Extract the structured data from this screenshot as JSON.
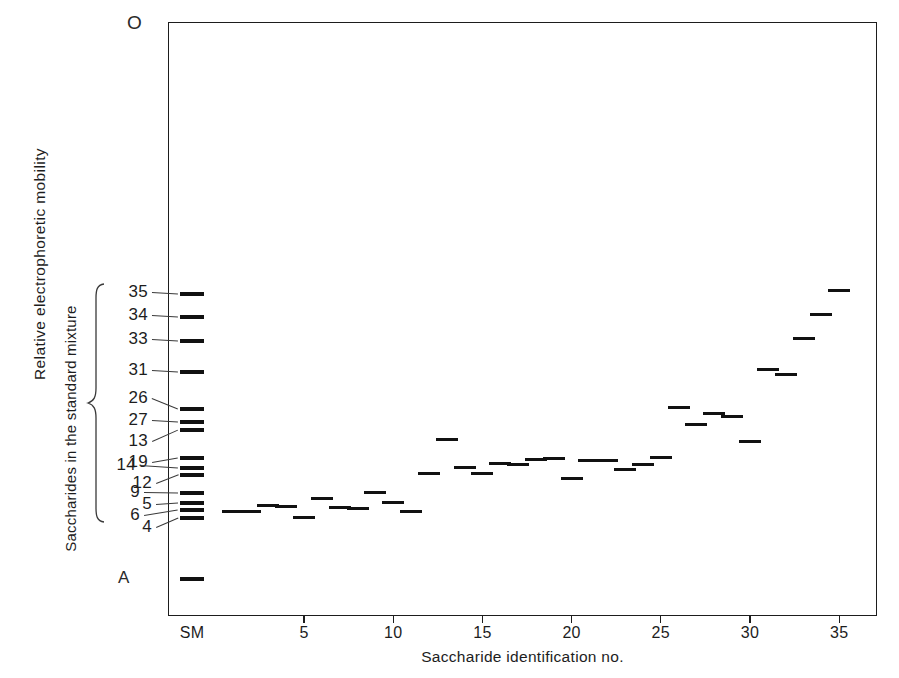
{
  "figure": {
    "origin_marker": "O",
    "ylabel_primary": "Relative  electrophoretic  mobility",
    "ylabel_secondary": "Saccharides in the standard mixture",
    "xlabel": "Saccharide identification no.",
    "anode_marker": "A"
  },
  "chart_data": {
    "type": "scatter",
    "title": "",
    "subtitle": "",
    "xlabel": "Saccharide identification no.",
    "ylabel": "Relative  electrophoretic  mobility",
    "grid": false,
    "legend": "none",
    "xlim": [
      0,
      36
    ],
    "xticks": [
      "SM",
      "5",
      "10",
      "15",
      "20",
      "25",
      "30",
      "35"
    ],
    "xtick_values": [
      0,
      5,
      10,
      15,
      20,
      25,
      30,
      35
    ],
    "ylim_px": [
      22,
      616
    ],
    "y_axis_direction": "inverted",
    "standard_mixture_lane": {
      "label": "SM",
      "x_value": 0,
      "bands": [
        {
          "id": "35",
          "mobility_px": 292
        },
        {
          "id": "34",
          "mobility_px": 315
        },
        {
          "id": "33",
          "mobility_px": 339
        },
        {
          "id": "31",
          "mobility_px": 370
        },
        {
          "id": "26",
          "mobility_px": 407
        },
        {
          "id": "27",
          "mobility_px": 420
        },
        {
          "id": "13",
          "mobility_px": 428
        },
        {
          "id": "19",
          "mobility_px": 456
        },
        {
          "id": "14",
          "mobility_px": 466
        },
        {
          "id": "12",
          "mobility_px": 473
        },
        {
          "id": "9",
          "mobility_px": 491
        },
        {
          "id": "5",
          "mobility_px": 501
        },
        {
          "id": "6",
          "mobility_px": 508
        },
        {
          "id": "4",
          "mobility_px": 516
        },
        {
          "id": "A",
          "mobility_px": 577
        }
      ],
      "label_order_top_to_bottom": [
        "35",
        "34",
        "33",
        "31",
        "26",
        "27",
        "13",
        "19",
        "14",
        "12",
        "9",
        "5",
        "6",
        "4"
      ]
    },
    "sample_lanes": [
      {
        "x": 1,
        "mobility_px": 510
      },
      {
        "x": 2,
        "mobility_px": 510
      },
      {
        "x": 3,
        "mobility_px": 504
      },
      {
        "x": 4,
        "mobility_px": 505
      },
      {
        "x": 5,
        "mobility_px": 516
      },
      {
        "x": 6,
        "mobility_px": 497
      },
      {
        "x": 7,
        "mobility_px": 506
      },
      {
        "x": 8,
        "mobility_px": 507
      },
      {
        "x": 9,
        "mobility_px": 491
      },
      {
        "x": 10,
        "mobility_px": 501
      },
      {
        "x": 11,
        "mobility_px": 510
      },
      {
        "x": 12,
        "mobility_px": 472
      },
      {
        "x": 13,
        "mobility_px": 438
      },
      {
        "x": 14,
        "mobility_px": 466
      },
      {
        "x": 15,
        "mobility_px": 472
      },
      {
        "x": 16,
        "mobility_px": 462
      },
      {
        "x": 17,
        "mobility_px": 463
      },
      {
        "x": 18,
        "mobility_px": 458
      },
      {
        "x": 19,
        "mobility_px": 457
      },
      {
        "x": 20,
        "mobility_px": 477
      },
      {
        "x": 21,
        "mobility_px": 459
      },
      {
        "x": 22,
        "mobility_px": 459
      },
      {
        "x": 23,
        "mobility_px": 468
      },
      {
        "x": 24,
        "mobility_px": 463
      },
      {
        "x": 25,
        "mobility_px": 456
      },
      {
        "x": 26,
        "mobility_px": 406
      },
      {
        "x": 27,
        "mobility_px": 423
      },
      {
        "x": 28,
        "mobility_px": 412
      },
      {
        "x": 29,
        "mobility_px": 415
      },
      {
        "x": 30,
        "mobility_px": 440
      },
      {
        "x": 31,
        "mobility_px": 368
      },
      {
        "x": 32,
        "mobility_px": 373
      },
      {
        "x": 33,
        "mobility_px": 337
      },
      {
        "x": 34,
        "mobility_px": 313
      },
      {
        "x": 35,
        "mobility_px": 289
      }
    ]
  },
  "style": {
    "band_color": "#111111",
    "frame_color": "#1d1d1d",
    "text_color": "#1d1d1d",
    "background": "#ffffff"
  }
}
